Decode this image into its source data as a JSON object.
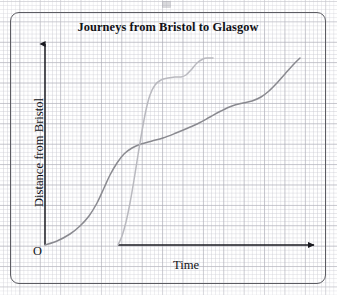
{
  "figure": {
    "title": "Journeys from Bristol to Glasgow",
    "origin_label": "O",
    "x_axis": {
      "label": "Time",
      "arrow": true
    },
    "y_axis": {
      "label": "Distance from Bristol",
      "arrow": true
    },
    "frame": {
      "style": "rounded-rectangle-border",
      "color": "#5c5c62"
    },
    "background": {
      "type": "graph-paper",
      "minor_color": "#cdcdd4",
      "major_color": "#aaaab4"
    }
  },
  "chart_data": {
    "type": "line",
    "title": "Journeys from Bristol to Glasgow",
    "xlabel": "Time",
    "ylabel": "Distance from Bristol",
    "grid": true,
    "legend": "none",
    "axes": {
      "x_origin_px": 45,
      "y_origin_px": 245,
      "x_ticks": [],
      "y_ticks": [],
      "note": "Axes are unlabelled/unscaled; qualitative distance-time graph"
    },
    "series": [
      {
        "name": "Journey 1 (car - gradual S-curve)",
        "color": "#8a8a90",
        "width": 1.5,
        "description": "Starts at origin, slow then speeds up, steady middle, slight slow, then speeds up to Glasgow",
        "points": [
          [
            45,
            245
          ],
          [
            57,
            241
          ],
          [
            70,
            234
          ],
          [
            80,
            226
          ],
          [
            89,
            216
          ],
          [
            97,
            203
          ],
          [
            104,
            188
          ],
          [
            110,
            175
          ],
          [
            117,
            163
          ],
          [
            124,
            154
          ],
          [
            132,
            148
          ],
          [
            141,
            144
          ],
          [
            152,
            141
          ],
          [
            163,
            138
          ],
          [
            176,
            133
          ],
          [
            188,
            128
          ],
          [
            199,
            123
          ],
          [
            210,
            117
          ],
          [
            221,
            111
          ],
          [
            232,
            106
          ],
          [
            243,
            103
          ],
          [
            252,
            101
          ],
          [
            261,
            97
          ],
          [
            269,
            91
          ],
          [
            277,
            83
          ],
          [
            285,
            74
          ],
          [
            293,
            65
          ],
          [
            300,
            58
          ]
        ]
      },
      {
        "name": "Journey 2 (train - steep with plateau)",
        "color": "#b9b9bf",
        "width": 1.5,
        "description": "Starts later, very fast, stops (flat section), then fast again, arrives early",
        "points": [
          [
            118,
            245
          ],
          [
            122,
            236
          ],
          [
            126,
            222
          ],
          [
            130,
            203
          ],
          [
            134,
            180
          ],
          [
            138,
            155
          ],
          [
            142,
            131
          ],
          [
            146,
            110
          ],
          [
            150,
            95
          ],
          [
            155,
            85
          ],
          [
            161,
            80
          ],
          [
            168,
            78
          ],
          [
            175,
            77
          ],
          [
            181,
            77
          ],
          [
            186,
            75
          ],
          [
            191,
            70
          ],
          [
            197,
            63
          ],
          [
            203,
            59
          ],
          [
            208,
            58
          ],
          [
            213,
            58
          ]
        ]
      }
    ]
  }
}
